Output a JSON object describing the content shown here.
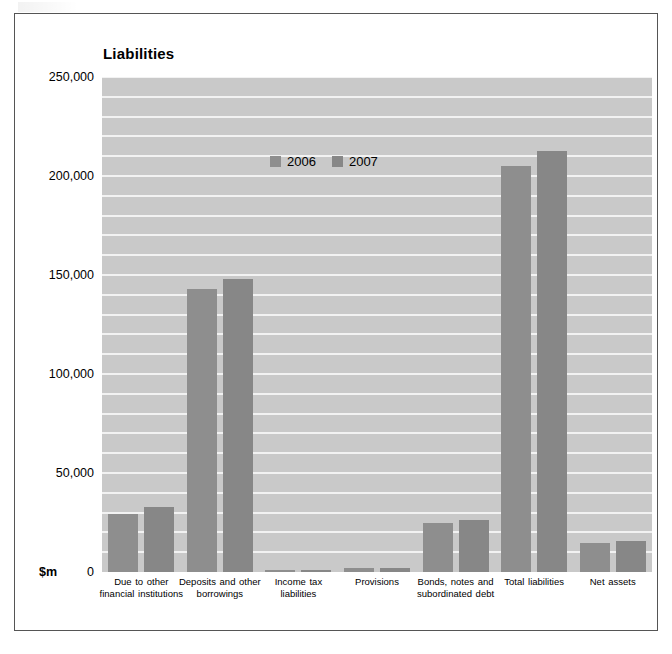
{
  "figure": {
    "title": "Liabilities"
  },
  "chart_data": {
    "type": "bar",
    "title": "Liabilities",
    "xlabel": "",
    "ylabel": "$m",
    "unit_label": "$m",
    "ylim": [
      0,
      250000
    ],
    "ytick_labels": [
      "0",
      "50,000",
      "100,000",
      "150,000",
      "200,000",
      "250,000"
    ],
    "yticks": [
      0,
      50000,
      100000,
      150000,
      200000,
      250000
    ],
    "grid": true,
    "grid_interval": 10000,
    "legend_position": "top-center",
    "categories": [
      "Due to other financial institutions",
      "Deposits and other borrowings",
      "Income tax liabilities",
      "Provisions",
      "Bonds, notes and subordinated debt",
      "Total liabilities",
      "Net assets"
    ],
    "category_lines": [
      [
        "Due to other",
        "financial institutions"
      ],
      [
        "Deposits and other",
        "borrowings"
      ],
      [
        "Income tax",
        "liabilities"
      ],
      [
        "Provisions"
      ],
      [
        "Bonds, notes and",
        "subordinated debt"
      ],
      [
        "Total liabilities"
      ],
      [
        "Net assets"
      ]
    ],
    "series": [
      {
        "name": "2006",
        "color": "#8e8e8e",
        "values": [
          29500,
          143000,
          1000,
          2000,
          25000,
          205000,
          14500
        ]
      },
      {
        "name": "2007",
        "color": "#878787",
        "values": [
          33000,
          148000,
          1000,
          2000,
          26500,
          212500,
          15500
        ]
      }
    ]
  }
}
